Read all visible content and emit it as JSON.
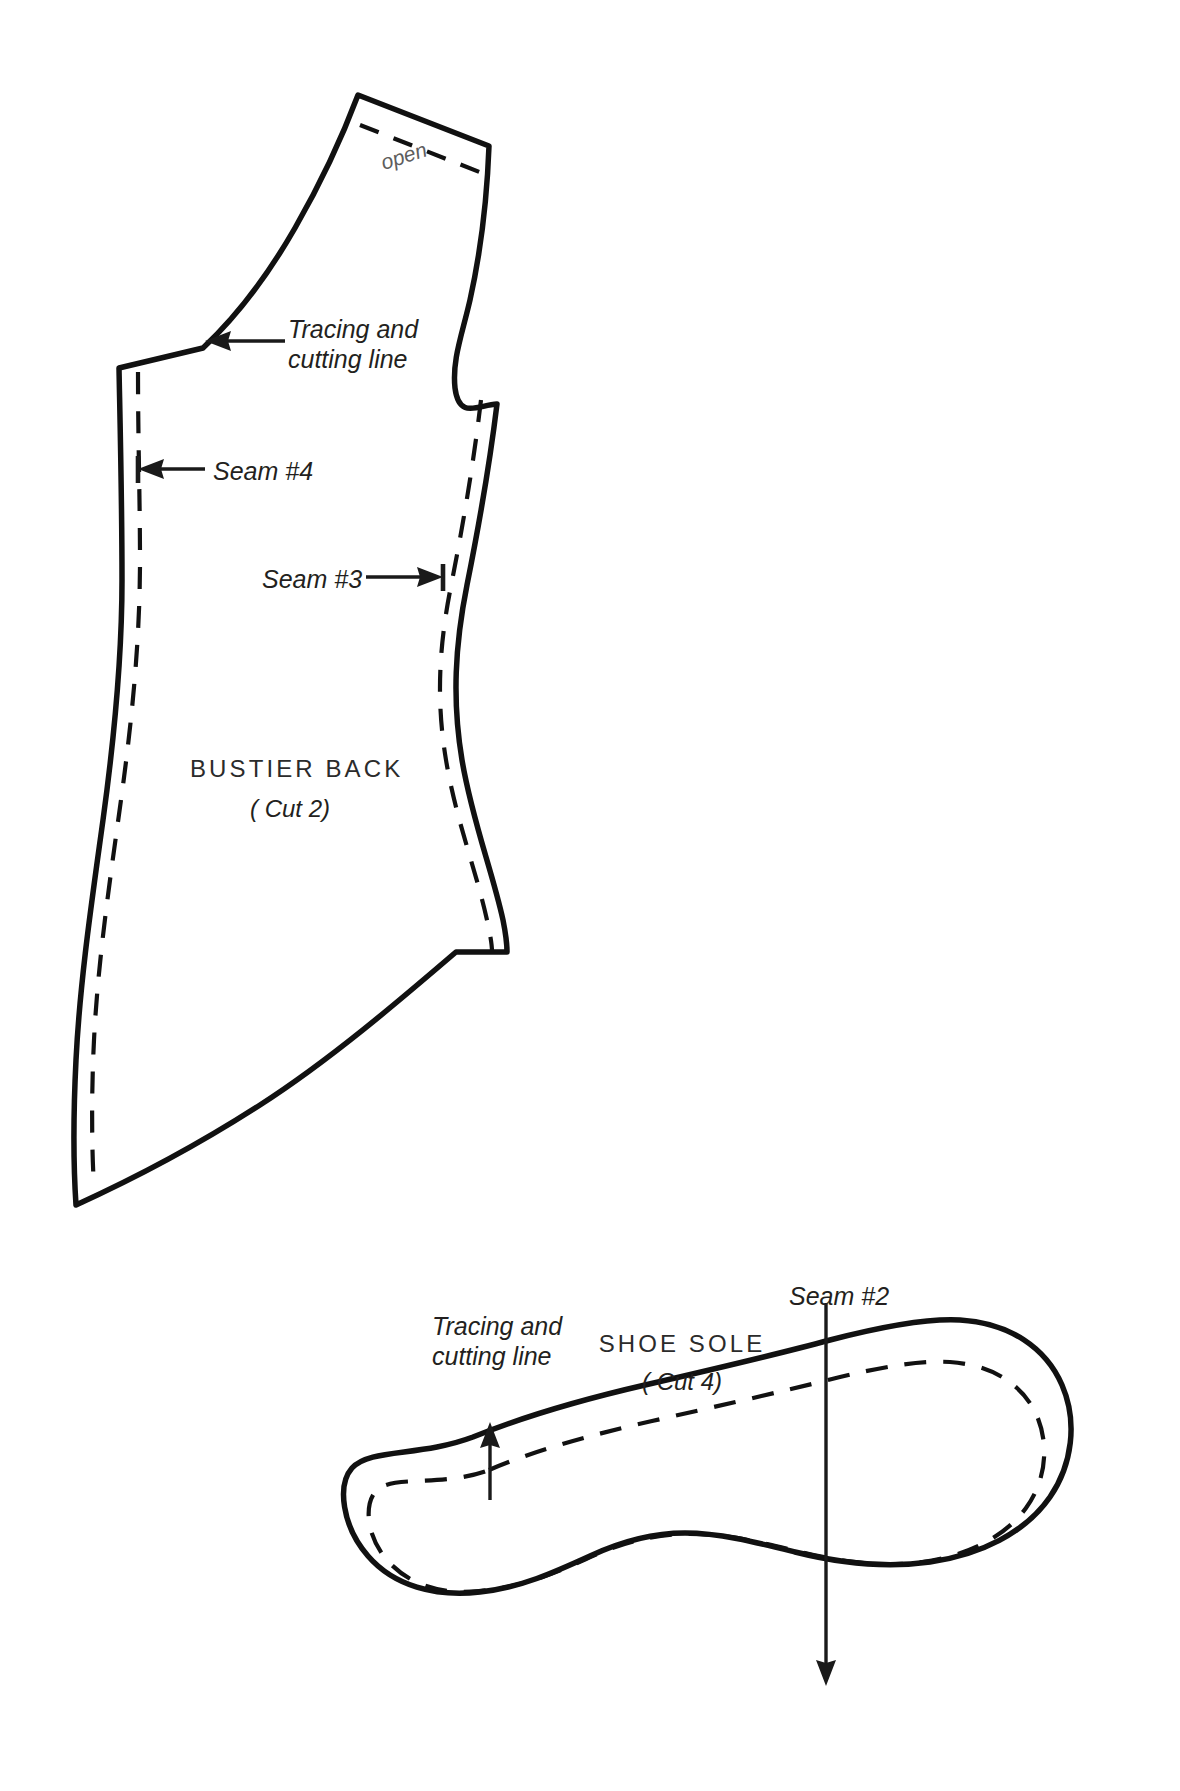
{
  "sheet": {
    "title": "Sewing pattern sheet",
    "background_color": "#ffffff",
    "ink_color": "#111111",
    "width": 1180,
    "height": 1791
  },
  "pieces": [
    {
      "id": "bustier-back",
      "name": "BUSTIER BACK",
      "cut_note": "( Cut 2)",
      "label_x": 290,
      "label_y": 855,
      "cut_x": 290,
      "cut_y": 895
    },
    {
      "id": "shoe-sole",
      "name": "SHOE SOLE",
      "cut_note": "( Cut 4)",
      "label_x": 682,
      "label_y": 1522,
      "cut_x": 682,
      "cut_y": 1562
    }
  ],
  "annotations": {
    "open": {
      "text": "open",
      "x": 378,
      "y": 160,
      "rotation_deg": -18
    },
    "tracing_cutting_top": {
      "line1": "Tracing and",
      "line2": "cutting line",
      "x": 288,
      "y": 315
    },
    "seam4": {
      "text": "Seam #4",
      "x": 213,
      "y": 457
    },
    "seam3": {
      "text": "Seam #3",
      "x": 262,
      "y": 565
    },
    "tracing_cutting_sole": {
      "line1": "Tracing and",
      "line2": "cutting line",
      "x": 432,
      "y": 1512
    },
    "seam2": {
      "text": "Seam #2",
      "x": 789,
      "y": 1282
    }
  },
  "legend": {
    "solid_line_meaning": "Tracing and cutting line",
    "dashed_line_meaning": "Seam line",
    "open_edge_meaning": "open"
  }
}
